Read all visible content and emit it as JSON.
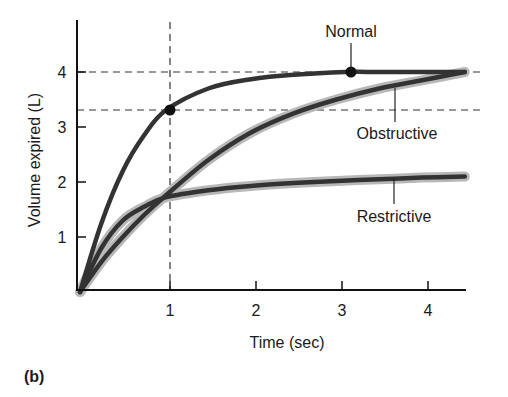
{
  "panel_label": "(b)",
  "chart_data": {
    "type": "line",
    "title": "",
    "xlabel": "Time (sec)",
    "ylabel": "Volume expired (L)",
    "xlim": [
      0,
      4.5
    ],
    "ylim": [
      0,
      4.9
    ],
    "x_ticks": [
      "1",
      "2",
      "3",
      "4"
    ],
    "y_ticks": [
      "1",
      "2",
      "3",
      "4"
    ],
    "grid": false,
    "legend": "none (direct curve annotations)",
    "series": [
      {
        "name": "Normal",
        "x": [
          0,
          0.25,
          0.5,
          0.75,
          1.0,
          1.5,
          2.0,
          2.5,
          3.1,
          3.5,
          4.0,
          4.5
        ],
        "values": [
          0,
          1.25,
          2.2,
          2.85,
          3.3,
          3.7,
          3.87,
          3.95,
          4.0,
          4.0,
          4.0,
          4.0
        ]
      },
      {
        "name": "Obstructive",
        "x": [
          0,
          0.25,
          0.5,
          0.75,
          1.0,
          1.5,
          2.0,
          2.5,
          3.0,
          3.5,
          4.0,
          4.5
        ],
        "values": [
          0,
          0.55,
          1.0,
          1.4,
          1.75,
          2.4,
          2.9,
          3.25,
          3.5,
          3.7,
          3.85,
          4.0
        ]
      },
      {
        "name": "Restrictive",
        "x": [
          0,
          0.25,
          0.5,
          0.75,
          1.0,
          1.5,
          2.0,
          2.5,
          3.0,
          3.5,
          4.0,
          4.5
        ],
        "values": [
          0,
          0.8,
          1.3,
          1.55,
          1.72,
          1.85,
          1.93,
          1.98,
          2.02,
          2.05,
          2.08,
          2.1
        ]
      }
    ],
    "reference_lines": [
      {
        "type": "vertical",
        "x": 1,
        "style": "dashed"
      },
      {
        "type": "horizontal",
        "y": 4,
        "style": "dashed"
      },
      {
        "type": "horizontal",
        "y": 3.3,
        "style": "dashed"
      }
    ],
    "markers": [
      {
        "series": "Normal",
        "x": 1,
        "y": 3.3,
        "meaning": "FEV1"
      },
      {
        "series": "Normal",
        "x": 3.1,
        "y": 4.0,
        "meaning": "FVC"
      }
    ],
    "annotations": [
      "Normal",
      "Obstructive",
      "Restrictive"
    ]
  }
}
